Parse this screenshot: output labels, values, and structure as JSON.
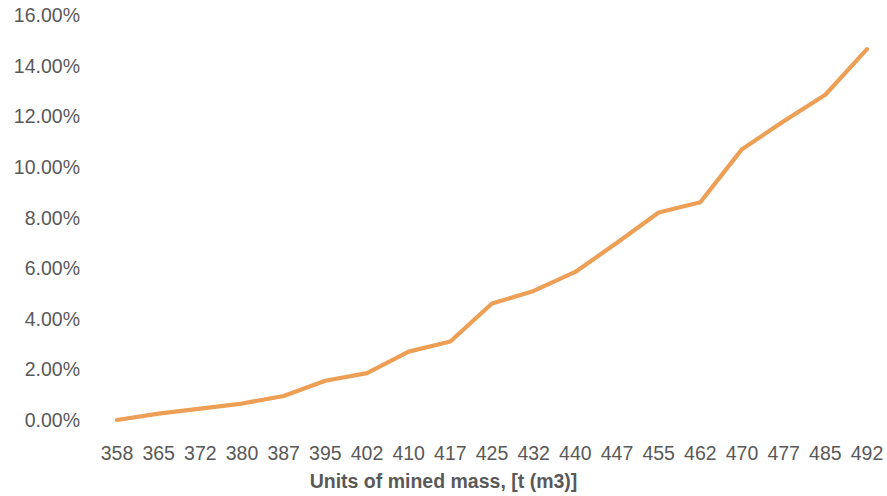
{
  "chart_data": {
    "type": "line",
    "title": "",
    "xlabel": "Units of mined mass, [t (m3)]",
    "ylabel": "",
    "categories": [
      "358",
      "365",
      "372",
      "380",
      "387",
      "395",
      "402",
      "410",
      "417",
      "425",
      "432",
      "440",
      "447",
      "455",
      "462",
      "470",
      "477",
      "485",
      "492"
    ],
    "values": [
      0.0,
      0.25,
      0.45,
      0.65,
      0.95,
      1.55,
      1.85,
      2.7,
      3.1,
      4.6,
      5.1,
      5.85,
      7.0,
      8.2,
      8.6,
      10.7,
      11.8,
      12.85,
      14.65
    ],
    "value_suffix": "%",
    "ytick_labels": [
      "16.00%",
      "14.00%",
      "12.00%",
      "10.00%",
      "8.00%",
      "6.00%",
      "4.00%",
      "2.00%",
      "0.00%"
    ],
    "ytick_values": [
      16,
      14,
      12,
      10,
      8,
      6,
      4,
      2,
      0
    ],
    "ylim": [
      0,
      16
    ],
    "grid": false,
    "legend": false,
    "series_color": "#ED9F56",
    "axis_text_color": "#595959"
  }
}
